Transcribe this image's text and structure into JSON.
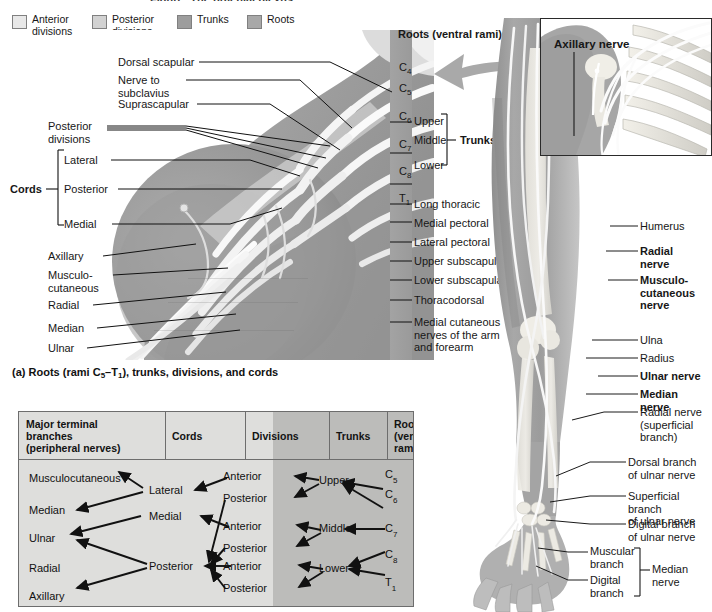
{
  "page": {
    "title_clipped": "Figure: The brachial plexus",
    "bg_color": "#ffffff"
  },
  "legend": {
    "items": [
      {
        "label": "Anterior\ndivisions",
        "color": "#e8e8e8",
        "name": "anterior-divisions"
      },
      {
        "label": "Posterior\ndivisions",
        "color": "#d2d2d2",
        "name": "posterior-divisions"
      },
      {
        "label": "Trunks",
        "color": "#9d9d9d",
        "name": "trunks"
      },
      {
        "label": "Roots",
        "color": "#a8a8a8",
        "name": "roots"
      }
    ]
  },
  "panel_a": {
    "caption_prefix": "(a) Roots (rami C",
    "caption_sub1": "5",
    "caption_mid": "–T",
    "caption_sub2": "1",
    "caption_suffix": "), trunks, divisions, and cords",
    "roots_heading": "Roots (ventral rami):",
    "cords_bracket_label": "Cords",
    "trunks_bracket_label": "Trunks",
    "top_labels": [
      {
        "text": "Dorsal scapular",
        "name": "label-dorsal-scapular"
      },
      {
        "text": "Nerve to\nsubclavius",
        "name": "label-nerve-to-subclavius"
      },
      {
        "text": "Suprascapular",
        "name": "label-suprascapular"
      }
    ],
    "left_labels": [
      {
        "text": "Posterior\ndivisions",
        "name": "label-posterior-divisions"
      },
      {
        "text": "Lateral",
        "name": "label-lateral-cord"
      },
      {
        "text": "Posterior",
        "name": "label-posterior-cord"
      },
      {
        "text": "Medial",
        "name": "label-medial-cord"
      },
      {
        "text": "Axillary",
        "name": "label-axillary"
      },
      {
        "text": "Musculo-\ncutaneous",
        "name": "label-musculocutaneous"
      },
      {
        "text": "Radial",
        "name": "label-radial"
      },
      {
        "text": "Median",
        "name": "label-median"
      },
      {
        "text": "Ulnar",
        "name": "label-ulnar"
      }
    ],
    "root_levels": [
      {
        "base": "C",
        "sub": "4",
        "name": "root-c4"
      },
      {
        "base": "C",
        "sub": "5",
        "name": "root-c5"
      },
      {
        "base": "C",
        "sub": "6",
        "name": "root-c6"
      },
      {
        "base": "C",
        "sub": "7",
        "name": "root-c7"
      },
      {
        "base": "C",
        "sub": "8",
        "name": "root-c8"
      },
      {
        "base": "T",
        "sub": "1",
        "name": "root-t1"
      }
    ],
    "trunk_labels": [
      {
        "text": "Upper",
        "name": "trunk-upper"
      },
      {
        "text": "Middle",
        "name": "trunk-middle"
      },
      {
        "text": "Lower",
        "name": "trunk-lower"
      }
    ],
    "right_labels": [
      {
        "text": "Long thoracic",
        "name": "label-long-thoracic"
      },
      {
        "text": "Medial pectoral",
        "name": "label-medial-pectoral"
      },
      {
        "text": "Lateral pectoral",
        "name": "label-lateral-pectoral"
      },
      {
        "text": "Upper subscapular",
        "name": "label-upper-subscapular"
      },
      {
        "text": "Lower subscapular",
        "name": "label-lower-subscapular"
      },
      {
        "text": "Thoracodorsal",
        "name": "label-thoracodorsal"
      },
      {
        "text": "Medial cutaneous\nnerves of the arm\nand forearm",
        "name": "label-medial-cutaneous"
      }
    ]
  },
  "flowchart": {
    "headers": [
      {
        "text": "Major terminal\nbranches\n(peripheral nerves)",
        "name": "col-major-terminal-branches"
      },
      {
        "text": "Cords",
        "name": "col-cords"
      },
      {
        "text": "Divisions",
        "name": "col-divisions"
      },
      {
        "text": "Trunks",
        "name": "col-trunks"
      },
      {
        "text": "Roots\n(ventral\nrami)",
        "name": "col-roots"
      }
    ],
    "terminal_branches": [
      {
        "text": "Musculocutaneous",
        "name": "node-musculocutaneous"
      },
      {
        "text": "Median",
        "name": "node-median"
      },
      {
        "text": "Ulnar",
        "name": "node-ulnar"
      },
      {
        "text": "Radial",
        "name": "node-radial"
      },
      {
        "text": "Axillary",
        "name": "node-axillary"
      }
    ],
    "cords": [
      {
        "text": "Lateral",
        "name": "node-lateral-cord"
      },
      {
        "text": "Medial",
        "name": "node-medial-cord"
      },
      {
        "text": "Posterior",
        "name": "node-posterior-cord"
      }
    ],
    "divisions": [
      {
        "text": "Anterior",
        "name": "node-division-anterior-1"
      },
      {
        "text": "Posterior",
        "name": "node-division-posterior-1"
      },
      {
        "text": "Anterior",
        "name": "node-division-anterior-2"
      },
      {
        "text": "Posterior",
        "name": "node-division-posterior-2"
      },
      {
        "text": "Anterior",
        "name": "node-division-anterior-3"
      },
      {
        "text": "Posterior",
        "name": "node-division-posterior-3"
      }
    ],
    "trunks": [
      {
        "text": "Upper",
        "name": "node-trunk-upper"
      },
      {
        "text": "Middle",
        "name": "node-trunk-middle"
      },
      {
        "text": "Lower",
        "name": "node-trunk-lower"
      }
    ],
    "roots": [
      {
        "base": "C",
        "sub": "5",
        "name": "node-root-c5"
      },
      {
        "base": "C",
        "sub": "6",
        "name": "node-root-c6"
      },
      {
        "base": "C",
        "sub": "7",
        "name": "node-root-c7"
      },
      {
        "base": "C",
        "sub": "8",
        "name": "node-root-c8"
      },
      {
        "base": "T",
        "sub": "1",
        "name": "node-root-t1"
      }
    ]
  },
  "panel_b": {
    "inset_label": "Axillary nerve",
    "labels": [
      {
        "text": "Humerus",
        "bold": false,
        "name": "label-humerus"
      },
      {
        "text": "Radial\nnerve",
        "bold": true,
        "name": "label-radial-nerve"
      },
      {
        "text": "Musculo-\ncutaneous\nnerve",
        "bold": true,
        "name": "label-musculocutaneous-nerve"
      },
      {
        "text": "Ulna",
        "bold": false,
        "name": "label-ulna"
      },
      {
        "text": "Radius",
        "bold": false,
        "name": "label-radius"
      },
      {
        "text": "Ulnar nerve",
        "bold": true,
        "name": "label-ulnar-nerve"
      },
      {
        "text": "Median\nnerve",
        "bold": true,
        "name": "label-median-nerve"
      },
      {
        "text": "Radial nerve\n(superficial\nbranch)",
        "bold": false,
        "name": "label-radial-nerve-superficial"
      },
      {
        "text": "Dorsal branch\nof ulnar nerve",
        "bold": false,
        "name": "label-dorsal-branch-ulnar"
      },
      {
        "text": "Superficial branch\nof ulnar nerve",
        "bold": false,
        "name": "label-superficial-branch-ulnar"
      },
      {
        "text": "Digital branch\nof ulnar nerve",
        "bold": false,
        "name": "label-digital-branch-ulnar"
      },
      {
        "text": "Muscular\nbranch",
        "bold": false,
        "name": "label-muscular-branch"
      },
      {
        "text": "Digital\nbranch",
        "bold": false,
        "name": "label-digital-branch"
      },
      {
        "text": "Median\nnerve",
        "bold": false,
        "name": "label-median-nerve-bracket"
      }
    ]
  }
}
